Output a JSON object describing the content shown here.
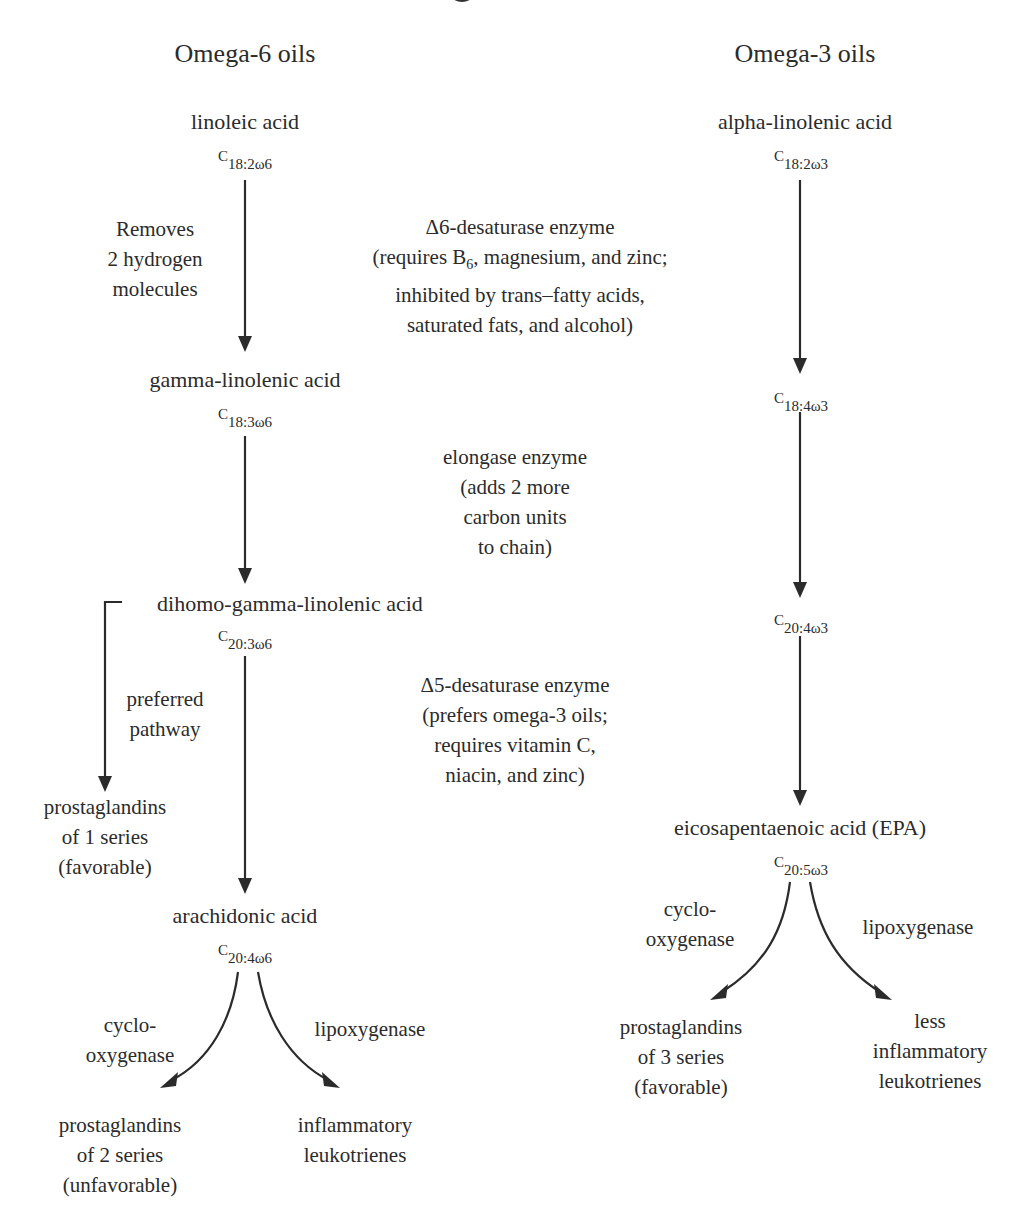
{
  "title_fragment": "",
  "columns": {
    "omega6": {
      "header": "Omega-6 oils"
    },
    "omega3": {
      "header": "Omega-3 oils"
    }
  },
  "omega6": {
    "linoleic": {
      "name": "linoleic acid",
      "formula_c": "C",
      "formula_sub": "18:2ω6"
    },
    "step1_note": [
      "Removes",
      "2 hydrogen",
      "molecules"
    ],
    "gamma": {
      "name": "gamma-linolenic acid",
      "formula_c": "C",
      "formula_sub": "18:3ω6"
    },
    "dgla": {
      "name": "dihomo-gamma-linolenic acid",
      "formula_c": "C",
      "formula_sub": "20:3ω6"
    },
    "preferred": [
      "preferred",
      "pathway"
    ],
    "pg1": [
      "prostaglandins",
      "of 1 series",
      "(favorable)"
    ],
    "arachidonic": {
      "name": "arachidonic acid",
      "formula_c": "C",
      "formula_sub": "20:4ω6"
    },
    "cyclo": [
      "cyclo-",
      "oxygenase"
    ],
    "lipo": "lipoxygenase",
    "pg2": [
      "prostaglandins",
      "of 2 series",
      "(unfavorable)"
    ],
    "leuko": [
      "inflammatory",
      "leukotrienes"
    ]
  },
  "enzymes": {
    "d6": [
      "Δ6-desaturase enzyme",
      "(requires B",
      "6",
      ", magnesium, and zinc;",
      "inhibited by trans–fatty acids,",
      "saturated fats, and alcohol)"
    ],
    "elongase": [
      "elongase enzyme",
      "(adds 2 more",
      "carbon units",
      "to chain)"
    ],
    "d5": [
      "Δ5-desaturase enzyme",
      "(prefers omega-3 oils;",
      "requires vitamin C,",
      "niacin, and zinc)"
    ]
  },
  "omega3": {
    "ala": {
      "name": "alpha-linolenic acid",
      "formula_c": "C",
      "formula_sub": "18:2ω3"
    },
    "sda": {
      "formula_c": "C",
      "formula_sub": "18:4ω3"
    },
    "eta": {
      "formula_c": "C",
      "formula_sub": "20:4ω3"
    },
    "epa": {
      "name": "eicosapentaenoic acid (EPA)",
      "formula_c": "C",
      "formula_sub": "20:5ω3"
    },
    "cyclo": [
      "cyclo-",
      "oxygenase"
    ],
    "lipo": "lipoxygenase",
    "pg3": [
      "prostaglandins",
      "of 3 series",
      "(favorable)"
    ],
    "leuko": [
      "less",
      "inflammatory",
      "leukotrienes"
    ]
  },
  "colors": {
    "ink": "#2b2b2b",
    "background": "#ffffff"
  }
}
